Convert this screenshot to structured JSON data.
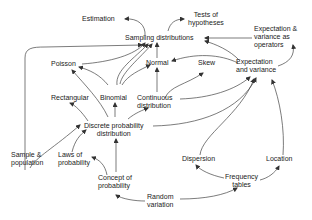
{
  "diagram": {
    "type": "concept-map",
    "nodes": {
      "estimation": "Estimation",
      "tests_of_hypotheses": "Tests of\nhypotheses",
      "sampling_distributions": "Sampling distributions",
      "expectation_variance_operators": "Expectation &\nvariance as\noperators",
      "poisson": "Poisson",
      "normal": "Normal",
      "skew": "Skew",
      "expectation_and_variance": "Expectation\nand variance",
      "rectangular": "Rectangular",
      "binomial": "Binomial",
      "continuous_distribution": "Continuous\ndistribution",
      "discrete_probability_distribution": "Discrete probability\ndistribution",
      "sample_population": "Sample &\npopulation",
      "laws_of_probability": "Laws of\nprobability",
      "concept_of_probability": "Concept of\nprobability",
      "random_variation": "Random\nvariation",
      "dispersion": "Dispersion",
      "frequency_tables": "Frequency\ntables",
      "location": "Location"
    },
    "edges": [
      [
        "sampling_distributions",
        "estimation"
      ],
      [
        "sampling_distributions",
        "tests_of_hypotheses"
      ],
      [
        "expectation_variance_operators",
        "sampling_distributions"
      ],
      [
        "expectation_and_variance",
        "sampling_distributions"
      ],
      [
        "expectation_and_variance",
        "normal"
      ],
      [
        "expectation_and_variance",
        "expectation_variance_operators"
      ],
      [
        "poisson",
        "sampling_distributions"
      ],
      [
        "binomial",
        "sampling_distributions"
      ],
      [
        "binomial",
        "poisson"
      ],
      [
        "binomial",
        "normal"
      ],
      [
        "normal",
        "sampling_distributions"
      ],
      [
        "continuous_distribution",
        "normal"
      ],
      [
        "continuous_distribution",
        "skew"
      ],
      [
        "continuous_distribution",
        "expectation_and_variance"
      ],
      [
        "discrete_probability_distribution",
        "rectangular"
      ],
      [
        "discrete_probability_distribution",
        "binomial"
      ],
      [
        "discrete_probability_distribution",
        "poisson"
      ],
      [
        "discrete_probability_distribution",
        "continuous_distribution"
      ],
      [
        "discrete_probability_distribution",
        "expectation_and_variance"
      ],
      [
        "sample_population",
        "sampling_distributions"
      ],
      [
        "sample_population",
        "discrete_probability_distribution"
      ],
      [
        "laws_of_probability",
        "discrete_probability_distribution"
      ],
      [
        "concept_of_probability",
        "laws_of_probability"
      ],
      [
        "concept_of_probability",
        "discrete_probability_distribution"
      ],
      [
        "random_variation",
        "concept_of_probability"
      ],
      [
        "random_variation",
        "frequency_tables"
      ],
      [
        "frequency_tables",
        "dispersion"
      ],
      [
        "frequency_tables",
        "location"
      ],
      [
        "dispersion",
        "expectation_and_variance"
      ],
      [
        "location",
        "expectation_and_variance"
      ]
    ]
  }
}
